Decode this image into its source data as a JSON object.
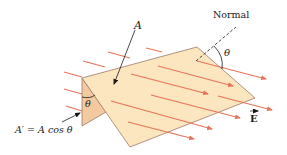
{
  "diagram": {
    "labels": {
      "area": "A",
      "normal": "Normal",
      "theta_top": "θ",
      "theta_side": "θ",
      "projected_area": "A′ = A cos θ",
      "field": "E"
    },
    "colors": {
      "surface_fill": "#fbe6bf",
      "surface_stroke": "#9a7a68",
      "projection_fill": "#f3c9a0",
      "field_lines": "#e8735a",
      "text": "#1a1a1a"
    }
  }
}
